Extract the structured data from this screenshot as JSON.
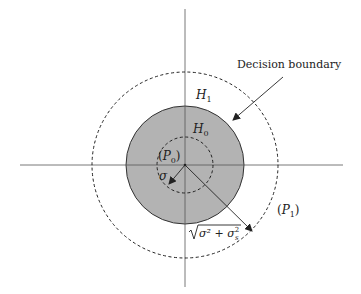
{
  "diagram": {
    "type": "decision-region",
    "colors": {
      "background": "#ffffff",
      "axis": "#555555",
      "fill": "#b3b3b3",
      "stroke": "#333333"
    },
    "labels": {
      "decision_boundary": "Decision boundary",
      "h1": "H",
      "h1_sub": "1",
      "h0": "H",
      "h0_sub": "0",
      "p0_open": "(",
      "p0": "P",
      "p0_sub": "0",
      "p0_close": ")",
      "sigma": "σ",
      "p1_open": "(",
      "p1": "P",
      "p1_sub": "1",
      "p1_close": ")",
      "sqrt_expr": "σ² + σ",
      "sqrt_sub": "s",
      "sqrt_sup": "2"
    },
    "geometry": {
      "center": [
        185,
        165
      ],
      "inner_dashed_radius": 28,
      "filled_circle_radius": 59,
      "outer_dashed_radius": 93
    }
  }
}
